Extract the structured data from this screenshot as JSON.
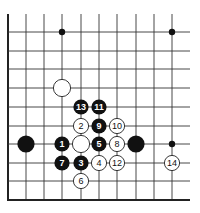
{
  "diagram": {
    "type": "go-board-partial",
    "grid": {
      "columns_x": [
        8,
        26,
        44,
        62,
        81,
        99,
        117,
        136,
        154,
        172
      ],
      "rows_y": [
        32,
        51,
        69,
        88,
        107,
        126,
        144,
        163,
        181
      ],
      "bottom_edge_y": 200,
      "left_edge_x": 8,
      "right_extent_x": 190,
      "top_extent_y": 14
    },
    "star_points": [
      {
        "col": 3,
        "row": 0
      },
      {
        "col": 9,
        "row": 0
      },
      {
        "col": 9,
        "row": 6
      }
    ],
    "stones": [
      {
        "color": "white",
        "col": 3,
        "row": 3,
        "label": ""
      },
      {
        "color": "black",
        "col": 1,
        "row": 6,
        "label": ""
      },
      {
        "color": "black",
        "col": 7,
        "row": 6,
        "label": ""
      },
      {
        "color": "white",
        "col": 4,
        "row": 6,
        "label": ""
      },
      {
        "color": "black",
        "col": 3,
        "row": 6,
        "label": "1"
      },
      {
        "color": "white",
        "col": 4,
        "row": 5,
        "label": "2"
      },
      {
        "color": "black",
        "col": 4,
        "row": 7,
        "label": "3"
      },
      {
        "color": "white",
        "col": 5,
        "row": 7,
        "label": "4"
      },
      {
        "color": "black",
        "col": 5,
        "row": 6,
        "label": "5"
      },
      {
        "color": "white",
        "col": 4,
        "row": 8,
        "label": "6"
      },
      {
        "color": "black",
        "col": 3,
        "row": 7,
        "label": "7"
      },
      {
        "color": "white",
        "col": 6,
        "row": 6,
        "label": "8"
      },
      {
        "color": "black",
        "col": 5,
        "row": 5,
        "label": "9"
      },
      {
        "color": "white",
        "col": 6,
        "row": 5,
        "label": "10"
      },
      {
        "color": "black",
        "col": 5,
        "row": 4,
        "label": "11"
      },
      {
        "color": "white",
        "col": 6,
        "row": 7,
        "label": "12"
      },
      {
        "color": "black",
        "col": 4,
        "row": 4,
        "label": "13"
      },
      {
        "color": "white",
        "col": 9,
        "row": 7,
        "label": "14"
      }
    ]
  }
}
